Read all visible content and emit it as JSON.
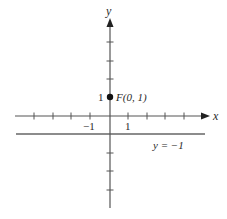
{
  "figure": {
    "colors": {
      "axis": "#555555",
      "line": "#666666",
      "point": "#111111",
      "text": "#2a2a2a",
      "background": "#ffffff"
    },
    "axes": {
      "x_label": "x",
      "y_label": "y"
    },
    "tick_labels": {
      "x_neg_one": "−1",
      "x_one": "1",
      "y_one": "1"
    },
    "focus": {
      "label": "F(0, 1)",
      "x": 0,
      "y": 1
    },
    "directrix": {
      "label": "y = −1",
      "equation_value": -1
    },
    "ticks": {
      "x": [
        -4,
        -3,
        -2,
        -1,
        1,
        2,
        3,
        4
      ],
      "y": [
        -4,
        -3,
        -2,
        1,
        2,
        3,
        4
      ]
    }
  }
}
